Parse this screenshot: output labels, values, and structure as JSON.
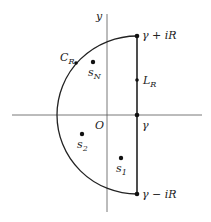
{
  "diagram": {
    "type": "contour",
    "axes": {
      "x_label": "",
      "y_label": "y",
      "origin_label": "O"
    },
    "contour": {
      "arc_label": "C",
      "arc_sub": "R",
      "line_label": "L",
      "line_sub": "R",
      "top_point": "γ + iR",
      "bottom_point": "γ − iR",
      "axis_point": "γ"
    },
    "singularities": [
      {
        "name": "s",
        "sub": "N"
      },
      {
        "name": "s",
        "sub": "2"
      },
      {
        "name": "s",
        "sub": "1"
      }
    ],
    "colors": {
      "stroke": "#222222",
      "axis": "#555555"
    }
  }
}
